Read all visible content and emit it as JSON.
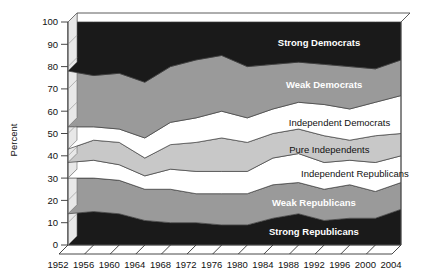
{
  "chart_data": {
    "type": "area",
    "title": "",
    "subtitle": "",
    "xlabel": "",
    "ylabel": "Percent",
    "xlim": [
      1952,
      2004
    ],
    "ylim": [
      0,
      100
    ],
    "grid": false,
    "legend_position": "inline-band-labels",
    "stacked": true,
    "x": [
      1952,
      1956,
      1960,
      1964,
      1968,
      1972,
      1976,
      1980,
      1984,
      1988,
      1992,
      1996,
      2000,
      2004
    ],
    "xticklabels": [
      "1952",
      "1956",
      "1960",
      "1964",
      "1968",
      "1972",
      "1976",
      "1980",
      "1984",
      "1988",
      "1992",
      "1996",
      "2000",
      "2004"
    ],
    "yticks": [
      0,
      10,
      20,
      30,
      40,
      50,
      60,
      70,
      80,
      90,
      100
    ],
    "yticklabels": [
      "0",
      "10",
      "20",
      "30",
      "40",
      "50",
      "60",
      "70",
      "80",
      "90",
      "100"
    ],
    "series": [
      {
        "name": "Strong Republicans",
        "label": "Strong Republicans",
        "color": "#1a1a1a",
        "label_color": "#ffffff",
        "values": [
          14,
          15,
          14,
          11,
          10,
          10,
          9,
          9,
          12,
          14,
          11,
          12,
          12,
          16
        ]
      },
      {
        "name": "Weak Republicans",
        "label": "Weak Republicans",
        "color": "#9a9a9a",
        "label_color": "#ffffff",
        "values": [
          16,
          15,
          15,
          14,
          15,
          13,
          14,
          14,
          15,
          14,
          14,
          15,
          12,
          12
        ]
      },
      {
        "name": "Independent Republicans",
        "label": "Independent Republicans",
        "color": "#ffffff",
        "label_color": "#111111",
        "values": [
          7,
          8,
          7,
          6,
          9,
          10,
          10,
          10,
          12,
          13,
          12,
          11,
          13,
          12
        ]
      },
      {
        "name": "Pure Independents",
        "label": "Pure Independents",
        "color": "#c8c8c8",
        "label_color": "#111111",
        "values": [
          6,
          9,
          10,
          8,
          11,
          13,
          15,
          13,
          11,
          11,
          12,
          9,
          12,
          10
        ]
      },
      {
        "name": "Independent Democrats",
        "label": "Independent Democrats",
        "color": "#ffffff",
        "label_color": "#111111",
        "values": [
          10,
          6,
          6,
          9,
          10,
          11,
          12,
          11,
          11,
          12,
          14,
          14,
          15,
          17
        ]
      },
      {
        "name": "Weak Democrats",
        "label": "Weak Democrats",
        "color": "#9a9a9a",
        "label_color": "#ffffff",
        "values": [
          25,
          23,
          25,
          25,
          25,
          26,
          25,
          23,
          20,
          18,
          18,
          19,
          15,
          16
        ]
      },
      {
        "name": "Strong Democrats",
        "label": "Strong Democrats",
        "color": "#1a1a1a",
        "label_color": "#ffffff",
        "values": [
          22,
          24,
          23,
          27,
          20,
          17,
          15,
          20,
          19,
          18,
          19,
          20,
          21,
          17
        ]
      }
    ]
  },
  "axis": {
    "ylabel": "Percent"
  }
}
